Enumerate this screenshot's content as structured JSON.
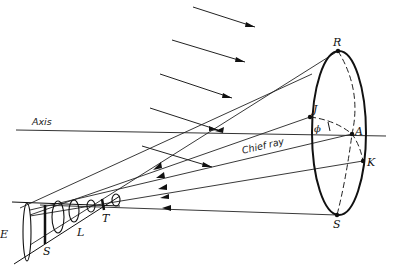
{
  "figure": {
    "type": "optical-diagram",
    "colors": {
      "ink": "#111111",
      "background": "#ffffff"
    }
  },
  "labels": {
    "axis": "Axis",
    "chief_ray": "Chief ray",
    "R": "R",
    "J": "J",
    "A": "A",
    "K": "K",
    "S_aperture": "S",
    "phi": "ϕ",
    "E": "E",
    "S_stop": "S",
    "L": "L",
    "T": "T"
  },
  "points": {
    "R": [
      338,
      51
    ],
    "J": [
      310,
      117
    ],
    "A": [
      352,
      134
    ],
    "K": [
      363,
      161
    ],
    "S": [
      337,
      215
    ],
    "T": [
      103,
      205
    ]
  },
  "aperture_ellipse": {
    "cx": 339,
    "cy": 133,
    "rx": 27,
    "ry": 82
  }
}
